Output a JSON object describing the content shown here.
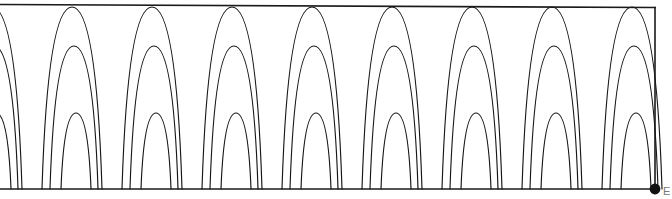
{
  "figure": {
    "name": "nested-oscillation-plot",
    "width": 672,
    "height": 199,
    "background_color": "#ffffff",
    "line_color": "#161616",
    "frame_color": "#1a1a1a",
    "marker_color": "#111111",
    "edge_label": "E"
  },
  "chart_data": {
    "type": "line",
    "title": "",
    "subtitle": "",
    "xlabel": "",
    "ylabel": "",
    "xlim": [
      0,
      672
    ],
    "ylim": [
      0,
      199
    ],
    "grid": false,
    "legend": null,
    "legend_position": "none",
    "axis_ticks": {
      "x": [],
      "y": []
    },
    "annotations": [
      {
        "name": "end-marker",
        "kind": "point-marker",
        "x": 655,
        "y": 189,
        "label": ""
      }
    ],
    "geometry": {
      "baseline_y": 189,
      "top_y": 6,
      "right_frame_x": 655,
      "period_px": 80,
      "peak_phase_offset_px": -8
    },
    "series": [
      {
        "name": "outer-arch",
        "peak_y": 7,
        "half_width_px": 30,
        "peak_x": [
          -8,
          72,
          152,
          232,
          312,
          392,
          472,
          552,
          632
        ],
        "values": [
          189,
          7,
          189,
          7,
          189,
          7,
          189,
          7,
          189,
          7,
          189,
          7,
          189,
          7,
          189,
          7,
          189
        ]
      },
      {
        "name": "middle-arch",
        "peak_y": 46,
        "half_width_px": 24,
        "peak_x": [
          -6,
          74,
          154,
          234,
          314,
          394,
          474,
          554,
          634
        ],
        "values": [
          189,
          46,
          189,
          46,
          189,
          46,
          189,
          46,
          189,
          46,
          189,
          46,
          189,
          46,
          189,
          46,
          189
        ]
      },
      {
        "name": "inner-arch",
        "peak_y": 113,
        "half_width_px": 15,
        "peak_x": [
          -4,
          76,
          156,
          236,
          316,
          396,
          476,
          556,
          636
        ],
        "values": [
          189,
          113,
          189,
          113,
          189,
          113,
          189,
          113,
          189,
          113,
          189,
          113,
          189,
          113,
          189,
          113,
          189
        ]
      }
    ]
  }
}
